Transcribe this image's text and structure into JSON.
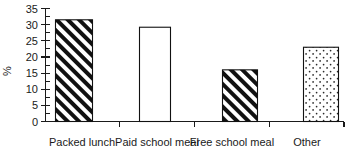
{
  "chart_data": {
    "type": "bar",
    "title": "",
    "xlabel": "",
    "ylabel": "%",
    "categories": [
      "Packed lunch",
      "Paid school meal",
      "Free school meal",
      "Other"
    ],
    "values": [
      31.5,
      29.2,
      16.0,
      23.0
    ],
    "ylim": [
      0,
      35
    ],
    "yticks": [
      0,
      5,
      10,
      15,
      20,
      25,
      30,
      35
    ],
    "ytick_labels": [
      "0",
      "5",
      "10",
      "15",
      "20",
      "25",
      "30",
      "35"
    ],
    "minor_ticks": true,
    "grid": false,
    "legend": "none",
    "bar_fills": [
      "diagonal-hatch",
      "solid-white",
      "diagonal-hatch",
      "dotted-stipple"
    ],
    "bar_edge_color": "#111111",
    "axis_color": "#1a1a1a",
    "background_color": "#ffffff"
  },
  "axis": {
    "y_title": "%",
    "y_tick_0": "0",
    "y_tick_5": "5",
    "y_tick_10": "10",
    "y_tick_15": "15",
    "y_tick_20": "20",
    "y_tick_25": "25",
    "y_tick_30": "30",
    "y_tick_35": "35"
  },
  "categories": {
    "c0": "Packed lunch",
    "c1": "Paid school meal",
    "c2": "Free school meal",
    "c3": "Other"
  }
}
